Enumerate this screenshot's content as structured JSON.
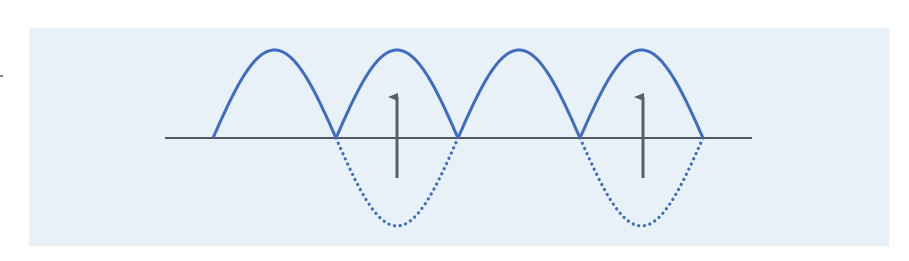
{
  "diagram": {
    "colors": {
      "background_panel": "#e8f1f8",
      "wave": "#3f6cc0",
      "axis": "#1f2328",
      "arrow": "#5a5f66"
    },
    "axis": {
      "x1": 165,
      "x2": 752,
      "y": 138
    },
    "crossings_x": [
      213,
      336,
      458,
      580,
      703
    ],
    "amplitude": 88,
    "solid_arches": 4,
    "dotted_lobes_under": [
      1,
      3
    ],
    "arrows": [
      {
        "x": 397,
        "y_bottom": 178,
        "y_top": 95
      },
      {
        "x": 643,
        "y_bottom": 178,
        "y_top": 95
      }
    ]
  }
}
